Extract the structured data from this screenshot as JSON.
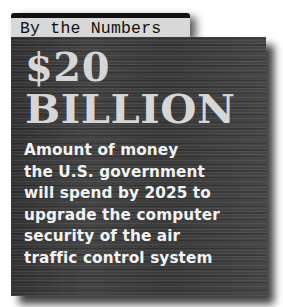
{
  "header": {
    "label": "By the Numbers"
  },
  "stat": {
    "amount": "$20",
    "unit": "BILLION",
    "description_lines": [
      "Amount of money",
      "the U.S. government",
      "will spend by 2025 to",
      "upgrade the computer",
      "security of the air",
      "traffic control system"
    ]
  },
  "colors": {
    "panel_background": "#3a3a3a",
    "tab_background": "#d8d8d8",
    "big_text": "#d6d6d6",
    "body_text": "#f2f2f2"
  }
}
